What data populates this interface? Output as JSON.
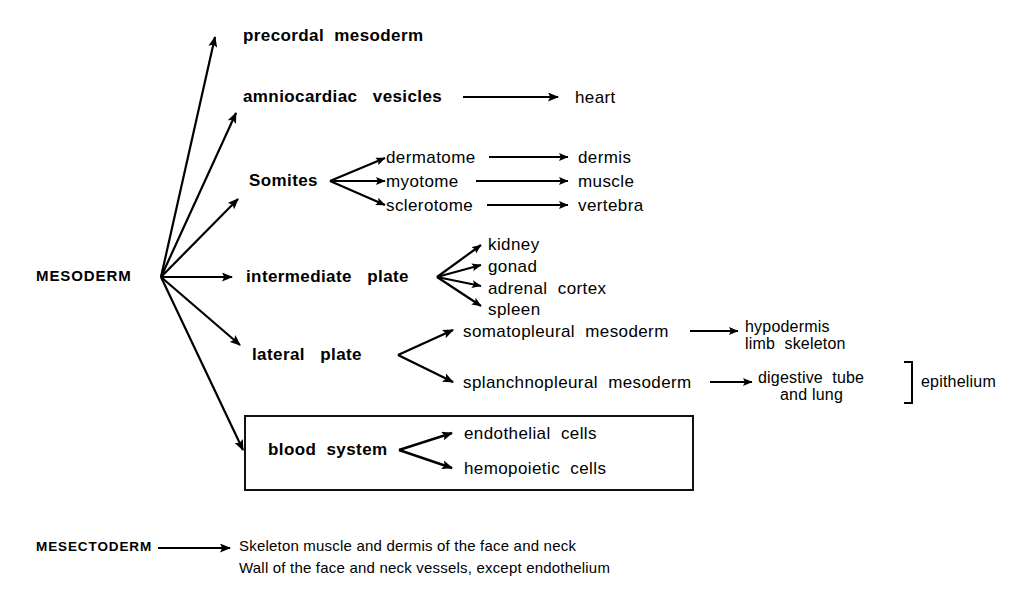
{
  "diagram": {
    "title_nodes": {
      "mesoderm": "MESODERM",
      "mesectoderm": "MESECTODERM"
    },
    "mesoderm_branches": [
      {
        "id": "precordal",
        "label": "precordal  mesoderm"
      },
      {
        "id": "amniocardiac",
        "label": "amniocardiac   vesicles"
      },
      {
        "id": "somites",
        "label": "Somites"
      },
      {
        "id": "intermediate",
        "label": "intermediate   plate"
      },
      {
        "id": "lateral",
        "label": "lateral   plate"
      },
      {
        "id": "blood",
        "label": "blood  system"
      }
    ],
    "amniocardiac_target": "heart",
    "somite_children": [
      {
        "label": "dermatome",
        "target": "dermis"
      },
      {
        "label": "myotome",
        "target": "muscle"
      },
      {
        "label": "sclerotome",
        "target": "vertebra"
      }
    ],
    "intermediate_children": [
      "kidney",
      "gonad",
      "adrenal  cortex",
      "spleen"
    ],
    "lateral_children": [
      {
        "label": "somatopleural  mesoderm",
        "target_line1": "hypodermis",
        "target_line2": "limb  skeleton"
      },
      {
        "label": "splanchnopleural  mesoderm",
        "target_line1": "digestive  tube",
        "target_line2": "and lung"
      }
    ],
    "bracket_label": "epithelium",
    "blood_children": [
      "endothelial  cells",
      "hemopoietic  cells"
    ],
    "mesectoderm_lines": [
      "Skeleton muscle and dermis of the face and neck",
      "Wall of the face and neck vessels, except endothelium"
    ],
    "colors": {
      "ink": "#000000",
      "background": "#ffffff",
      "box_border": "#111111"
    }
  }
}
